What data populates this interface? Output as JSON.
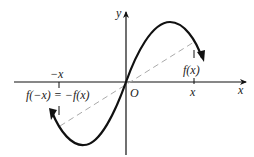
{
  "diagram": {
    "type": "odd-function-graph",
    "axes": {
      "x_label": "x",
      "y_label": "y",
      "origin_label": "O"
    },
    "labels": {
      "pos_x": "x",
      "neg_x": "−x",
      "f_x": "f(x)",
      "f_neg_x": "f(−x) = −f(x)"
    },
    "colors": {
      "curve": "#111111",
      "axes": "#111111",
      "dashed_line": "#aaaaaa"
    }
  }
}
